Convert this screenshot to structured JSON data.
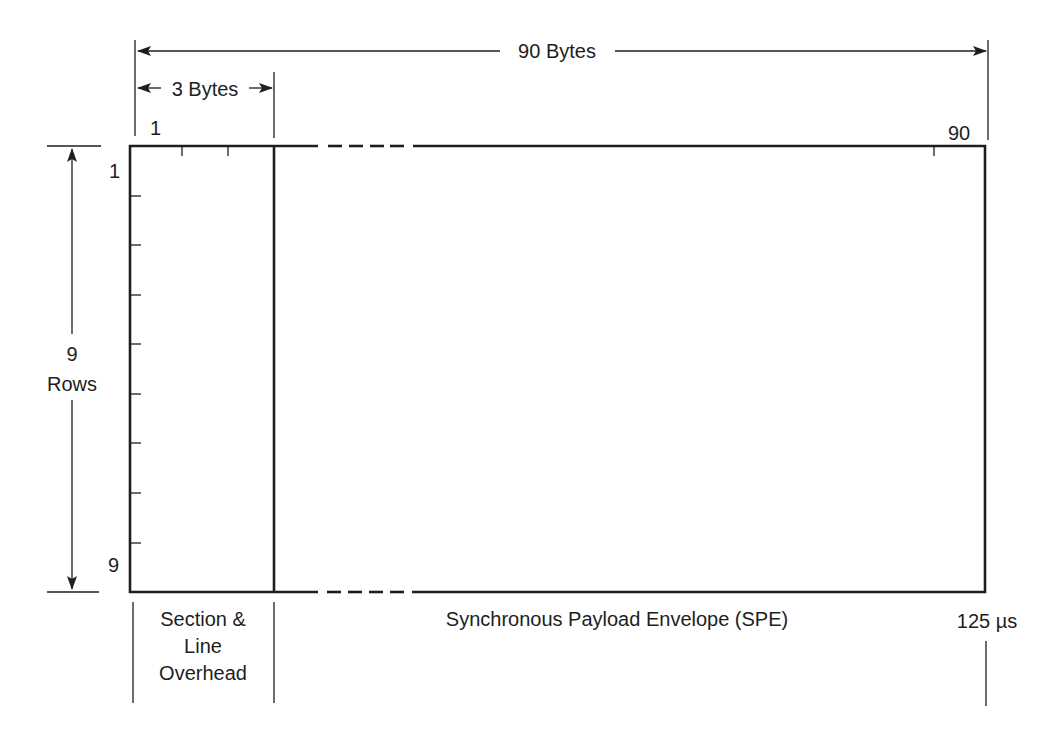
{
  "diagram": {
    "colors": {
      "line": "#1e1e1e",
      "background": "#ffffff"
    },
    "width_dimension": {
      "label": "90 Bytes"
    },
    "overhead_dimension": {
      "label": "3 Bytes"
    },
    "height_dimension": {
      "count": "9",
      "unit": "Rows"
    },
    "column_labels": {
      "first": "1",
      "last": "90"
    },
    "row_labels": {
      "first": "1",
      "last": "9"
    },
    "regions": {
      "overhead": {
        "line1": "Section &",
        "line2": "Line",
        "line3": "Overhead"
      },
      "payload": {
        "label": "Synchronous Payload Envelope (SPE)"
      }
    },
    "time_marker": {
      "label": "125 µs"
    }
  }
}
